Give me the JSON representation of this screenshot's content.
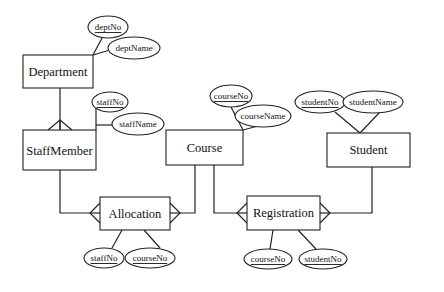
{
  "diagram": {
    "type": "entity-relationship",
    "notation": "crow's foot",
    "entities": [
      {
        "id": "department",
        "label": "Department"
      },
      {
        "id": "staffmember",
        "label": "StaffMember"
      },
      {
        "id": "course",
        "label": "Course"
      },
      {
        "id": "student",
        "label": "Student"
      },
      {
        "id": "allocation",
        "label": "Allocation"
      },
      {
        "id": "registration",
        "label": "Registration"
      }
    ],
    "attributes": {
      "department": [
        {
          "label": "deptNo",
          "key": true
        },
        {
          "label": "deptName",
          "key": false
        }
      ],
      "staffmember": [
        {
          "label": "staffNo",
          "key": true
        },
        {
          "label": "staffName",
          "key": false
        }
      ],
      "course": [
        {
          "label": "courseNo",
          "key": true
        },
        {
          "label": "courseName",
          "key": false
        }
      ],
      "student": [
        {
          "label": "studentNo",
          "key": true
        },
        {
          "label": "studentName",
          "key": false
        }
      ],
      "allocation": [
        {
          "label": "staffNo",
          "key": true
        },
        {
          "label": "courseNo",
          "key": true
        }
      ],
      "registration": [
        {
          "label": "courseNo",
          "key": true
        },
        {
          "label": "studentNo",
          "key": true
        }
      ]
    },
    "relationships": [
      {
        "from": "Department",
        "to": "StaffMember",
        "cardinality": "one-to-many"
      },
      {
        "from": "StaffMember",
        "to": "Allocation",
        "cardinality": "one-to-many"
      },
      {
        "from": "Course",
        "to": "Allocation",
        "cardinality": "one-to-many"
      },
      {
        "from": "Course",
        "to": "Registration",
        "cardinality": "one-to-many"
      },
      {
        "from": "Student",
        "to": "Registration",
        "cardinality": "one-to-many"
      }
    ]
  }
}
